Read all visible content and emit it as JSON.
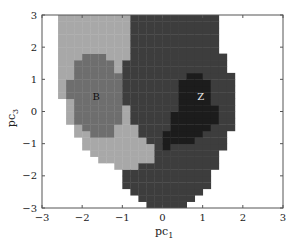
{
  "chart_data": {
    "type": "heatmap",
    "title": "",
    "xlabel": "pc",
    "xlabel_sub": "1",
    "ylabel": "pc",
    "ylabel_sub": "3",
    "xlim": [
      -3,
      3
    ],
    "ylim": [
      -3,
      3
    ],
    "x_ticks": [
      -3,
      -2,
      -1,
      0,
      1,
      2,
      3
    ],
    "y_ticks": [
      -3,
      -2,
      -1,
      0,
      1,
      2,
      3
    ],
    "grid": false,
    "legend": null,
    "classes": [
      {
        "name": "background",
        "color": "#ffffff"
      },
      {
        "name": "outer-B",
        "color": "#a8a8a8"
      },
      {
        "name": "B",
        "color": "#6e6e6e"
      },
      {
        "name": "outer-Z",
        "color": "#3d3d3d"
      },
      {
        "name": "Z",
        "color": "#1c1c1c"
      }
    ],
    "regions": [
      {
        "class": "outer-B",
        "polygon": [
          [
            -2.65,
            3
          ],
          [
            -0.85,
            3
          ],
          [
            -0.75,
            2.5
          ],
          [
            -0.9,
            1.5
          ],
          [
            -0.95,
            0.5
          ],
          [
            -0.75,
            -0.3
          ],
          [
            -0.4,
            -0.9
          ],
          [
            -0.1,
            -1.2
          ],
          [
            -0.3,
            -1.5
          ],
          [
            -0.6,
            -1.7
          ],
          [
            -0.9,
            -1.8
          ],
          [
            -1.2,
            -1.75
          ],
          [
            -1.5,
            -1.5
          ],
          [
            -1.9,
            -1.2
          ],
          [
            -2.2,
            -0.6
          ],
          [
            -2.45,
            0
          ],
          [
            -2.55,
            1
          ],
          [
            -2.6,
            2
          ],
          [
            -2.7,
            2.6
          ]
        ]
      },
      {
        "class": "outer-Z",
        "polygon": [
          [
            -0.85,
            3
          ],
          [
            1.35,
            3
          ],
          [
            1.35,
            2.2
          ],
          [
            1.6,
            1.6
          ],
          [
            1.8,
            1
          ],
          [
            1.75,
            0
          ],
          [
            1.7,
            -0.6
          ],
          [
            1.55,
            -1.0
          ],
          [
            1.4,
            -1.5
          ],
          [
            1.2,
            -2.2
          ],
          [
            0.9,
            -2.7
          ],
          [
            0.6,
            -3
          ],
          [
            -0.2,
            -3
          ],
          [
            -0.6,
            -2.6
          ],
          [
            -0.9,
            -2.3
          ],
          [
            -1.1,
            -2.0
          ],
          [
            -0.6,
            -1.7
          ],
          [
            -0.3,
            -1.5
          ],
          [
            -0.1,
            -1.2
          ],
          [
            -0.4,
            -0.9
          ],
          [
            -0.75,
            -0.3
          ],
          [
            -0.95,
            0.5
          ],
          [
            -0.9,
            1.5
          ],
          [
            -0.75,
            2.5
          ]
        ]
      },
      {
        "class": "B",
        "polygon": [
          [
            -2.25,
            1.3
          ],
          [
            -2.0,
            1.8
          ],
          [
            -1.55,
            1.95
          ],
          [
            -1.3,
            1.7
          ],
          [
            -1.05,
            1.1
          ],
          [
            -0.95,
            0.4
          ],
          [
            -1.0,
            -0.3
          ],
          [
            -1.25,
            -0.75
          ],
          [
            -1.6,
            -0.85
          ],
          [
            -1.95,
            -0.6
          ],
          [
            -2.2,
            -0.2
          ],
          [
            -2.35,
            0.6
          ]
        ]
      },
      {
        "class": "Z",
        "polygon": [
          [
            0.55,
            1.2
          ],
          [
            0.95,
            1.25
          ],
          [
            1.2,
            0.9
          ],
          [
            1.3,
            0.3
          ],
          [
            1.35,
            -0.3
          ],
          [
            1.05,
            -0.7
          ],
          [
            0.6,
            -1.05
          ],
          [
            0.1,
            -1.1
          ],
          [
            -0.05,
            -0.9
          ],
          [
            0.15,
            -0.5
          ],
          [
            0.35,
            0.1
          ],
          [
            0.45,
            0.7
          ]
        ]
      }
    ],
    "annotations": [
      {
        "text": "B",
        "x": -1.65,
        "y": 0.35
      },
      {
        "text": "Z",
        "x": 0.95,
        "y": 0.35
      }
    ]
  },
  "labels": {
    "x_ticks": [
      "−3",
      "−2",
      "−1",
      "0",
      "1",
      "2",
      "3"
    ],
    "y_ticks": [
      "−3",
      "−2",
      "−1",
      "0",
      "1",
      "2",
      "3"
    ],
    "xlabel": "pc",
    "xlabel_sub": "1",
    "ylabel": "pc",
    "ylabel_sub": "3",
    "annot_b": "B",
    "annot_z": "Z"
  }
}
